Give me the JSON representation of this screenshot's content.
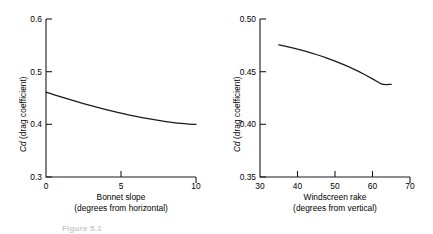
{
  "figure": {
    "caption_fragment": "Figure 5.1",
    "background": "#ffffff",
    "line_color": "#1a1a1a",
    "axis_color": "#1a1a1a"
  },
  "chart_data": [
    {
      "type": "line",
      "title": "",
      "xlabel": "Bonnet slope",
      "xlabel_line2": "(degrees from horizontal)",
      "ylabel": "Cd (drag coefficient)",
      "ylabel_symbol": "Cd",
      "ylabel_rest": " (drag coefficient)",
      "xlim": [
        0,
        10
      ],
      "ylim": [
        0.3,
        0.6
      ],
      "xticks": [
        0,
        5,
        10
      ],
      "xticklabels": [
        "0",
        "5",
        "10"
      ],
      "yticks": [
        0.3,
        0.4,
        0.5,
        0.6
      ],
      "yticklabels": [
        "0.3",
        "0.4",
        "0.5",
        "0.6"
      ],
      "grid": false,
      "legend": "none",
      "series": [
        {
          "name": "Cd vs bonnet slope",
          "x": [
            0,
            0.5,
            1,
            1.5,
            2,
            2.5,
            3,
            3.5,
            4,
            4.5,
            5,
            5.5,
            6,
            6.5,
            7,
            7.5,
            8,
            8.5,
            9,
            9.5,
            10
          ],
          "y": [
            0.461,
            0.4565,
            0.452,
            0.4477,
            0.4435,
            0.4395,
            0.4356,
            0.4318,
            0.4281,
            0.4246,
            0.4213,
            0.4181,
            0.4151,
            0.4123,
            0.4097,
            0.4073,
            0.4051,
            0.4032,
            0.4017,
            0.4006,
            0.4
          ]
        }
      ]
    },
    {
      "type": "line",
      "title": "",
      "xlabel": "Windscreen rake",
      "xlabel_line2": "(degrees from vertical)",
      "ylabel": "Cd (drag coefficient)",
      "ylabel_symbol": "Cd",
      "ylabel_rest": " (drag coefficient)",
      "xlim": [
        30,
        70
      ],
      "ylim": [
        0.35,
        0.5
      ],
      "xticks": [
        30,
        40,
        50,
        60,
        70
      ],
      "xticklabels": [
        "30",
        "40",
        "50",
        "60",
        "70"
      ],
      "yticks": [
        0.35,
        0.4,
        0.45,
        0.5
      ],
      "yticklabels": [
        "0.35",
        "0.40",
        "0.45",
        "0.50"
      ],
      "grid": false,
      "legend": "none",
      "series": [
        {
          "name": "Cd vs windscreen rake",
          "x": [
            35,
            37.5,
            40,
            42.5,
            45,
            47.5,
            50,
            52.5,
            55,
            57.5,
            60,
            62.5,
            65
          ],
          "y": [
            0.4755,
            0.4736,
            0.4714,
            0.469,
            0.4663,
            0.4633,
            0.46,
            0.4564,
            0.4524,
            0.448,
            0.4432,
            0.4382,
            0.438
          ]
        }
      ]
    }
  ]
}
